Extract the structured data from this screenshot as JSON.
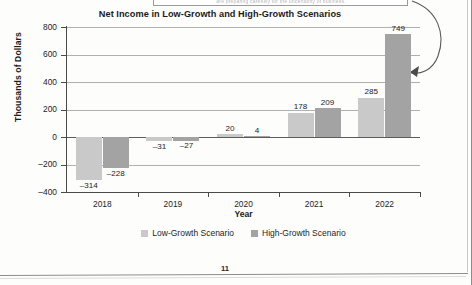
{
  "document": {
    "page_number": "11",
    "cutoff_note": "are preparing carefully for the uncertainty of business."
  },
  "annotation": {
    "arrow_name": "curved-callout-arrow",
    "points_to": "749"
  },
  "legend": {
    "position": "bottom-center",
    "items": [
      {
        "label": "Low-Growth Scenario",
        "color": "#c9c9c9"
      },
      {
        "label": "High-Growth Scenario",
        "color": "#a3a3a3"
      }
    ]
  },
  "chart_data": {
    "type": "bar",
    "title": "Net Income in Low-Growth and High-Growth Scenarios",
    "xlabel": "Year",
    "ylabel": "Thousands of Dollars",
    "categories": [
      "2018",
      "2019",
      "2020",
      "2021",
      "2022"
    ],
    "ylim": [
      -400,
      800
    ],
    "yticks": [
      "800",
      "600",
      "400",
      "200",
      "0",
      "-200",
      "-400"
    ],
    "ytick_values": [
      800,
      600,
      400,
      200,
      0,
      -200,
      -400
    ],
    "grid": true,
    "series": [
      {
        "name": "Low-Growth Scenario",
        "color": "#c9c9c9",
        "values": [
          -314,
          -31,
          20,
          178,
          285
        ],
        "labels": [
          "-314",
          "-31",
          "20",
          "178",
          "285"
        ]
      },
      {
        "name": "High-Growth Scenario",
        "color": "#a3a3a3",
        "values": [
          -228,
          -27,
          4,
          209,
          749
        ],
        "labels": [
          "-228",
          "-27",
          "4",
          "209",
          "749"
        ]
      }
    ]
  }
}
